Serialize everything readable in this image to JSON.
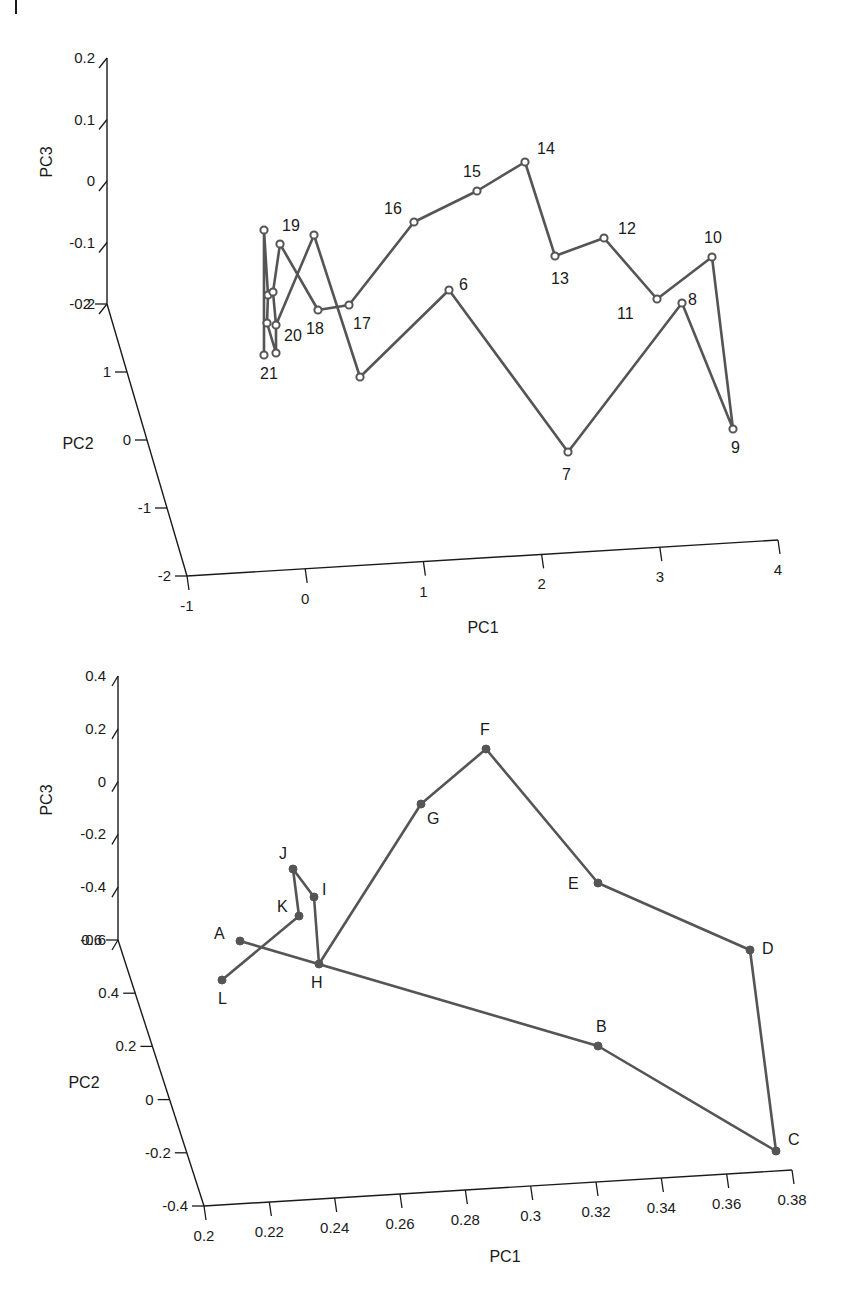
{
  "page_marker": "|",
  "chart_data": [
    {
      "type": "scatter3d-line",
      "title": "",
      "xlabel": "PC1",
      "ylabel": "PC2",
      "zlabel": "PC3",
      "x_ticks": [
        "-1",
        "0",
        "1",
        "2",
        "3",
        "4"
      ],
      "y_ticks": [
        "-2",
        "-1",
        "0",
        "1",
        "2"
      ],
      "z_ticks": [
        "-0.2",
        "-0.1",
        "0",
        "0.1",
        "0.2"
      ],
      "xlim": [
        -1,
        4
      ],
      "ylim": [
        -2,
        2
      ],
      "zlim": [
        -0.2,
        0.2
      ],
      "marker": "open-circle",
      "grid": false,
      "point_labels": [
        "6",
        "7",
        "8",
        "9",
        "10",
        "11",
        "12",
        "13",
        "14",
        "15",
        "16",
        "17",
        "18",
        "19",
        "20",
        "21"
      ],
      "screen_points": [
        {
          "label": "21",
          "px": 264,
          "py": 355
        },
        {
          "label": "",
          "px": 276,
          "py": 353
        },
        {
          "label": "",
          "px": 267,
          "py": 323
        },
        {
          "label": "20",
          "px": 276,
          "py": 325
        },
        {
          "label": "",
          "px": 268,
          "py": 295
        },
        {
          "label": "",
          "px": 273,
          "py": 292
        },
        {
          "label": "",
          "px": 264,
          "py": 230
        },
        {
          "label": "",
          "px": 280,
          "py": 244
        },
        {
          "label": "19",
          "px": 314,
          "py": 235
        },
        {
          "label": "18",
          "px": 318,
          "py": 310
        },
        {
          "label": "17",
          "px": 349,
          "py": 305
        },
        {
          "label": "16",
          "px": 414,
          "py": 222
        },
        {
          "label": "15",
          "px": 477,
          "py": 191
        },
        {
          "label": "14",
          "px": 525,
          "py": 162
        },
        {
          "label": "13",
          "px": 555,
          "py": 256
        },
        {
          "label": "12",
          "px": 604,
          "py": 238
        },
        {
          "label": "11",
          "px": 657,
          "py": 299
        },
        {
          "label": "10",
          "px": 712,
          "py": 257
        },
        {
          "label": "9",
          "px": 733,
          "py": 429
        },
        {
          "label": "8",
          "px": 682,
          "py": 303
        },
        {
          "label": "7",
          "px": 568,
          "py": 452
        },
        {
          "label": "6",
          "px": 449,
          "py": 290
        },
        {
          "label": "",
          "px": 360,
          "py": 377
        }
      ]
    },
    {
      "type": "scatter3d-line",
      "title": "",
      "xlabel": "PC1",
      "ylabel": "PC2",
      "zlabel": "PC3",
      "x_ticks": [
        "0.2",
        "0.22",
        "0.24",
        "0.26",
        "0.28",
        "0.3",
        "0.32",
        "0.34",
        "0.36",
        "0.38"
      ],
      "y_ticks": [
        "-0.4",
        "-0.2",
        "0",
        "0.2",
        "0.4",
        "0.6"
      ],
      "z_ticks": [
        "-0.6",
        "-0.4",
        "-0.2",
        "0",
        "0.2",
        "0.4"
      ],
      "xlim": [
        0.2,
        0.38
      ],
      "ylim": [
        -0.4,
        0.6
      ],
      "zlim": [
        -0.6,
        0.4
      ],
      "marker": "filled-circle",
      "grid": false,
      "point_labels": [
        "A",
        "B",
        "C",
        "D",
        "E",
        "F",
        "G",
        "H",
        "I",
        "J",
        "K",
        "L"
      ],
      "sequence": [
        "A",
        "B",
        "C",
        "D",
        "E",
        "F",
        "G",
        "H",
        "I",
        "J",
        "K",
        "L"
      ],
      "screen_points": [
        {
          "label": "A",
          "px": 240,
          "py": 941
        },
        {
          "label": "B",
          "px": 598,
          "py": 1046
        },
        {
          "label": "C",
          "px": 776,
          "py": 1151
        },
        {
          "label": "D",
          "px": 750,
          "py": 950
        },
        {
          "label": "E",
          "px": 598,
          "py": 883
        },
        {
          "label": "F",
          "px": 486,
          "py": 749
        },
        {
          "label": "G",
          "px": 421,
          "py": 804
        },
        {
          "label": "H",
          "px": 319,
          "py": 964
        },
        {
          "label": "I",
          "px": 314,
          "py": 897
        },
        {
          "label": "J",
          "px": 293,
          "py": 869
        },
        {
          "label": "K",
          "px": 299,
          "py": 916
        },
        {
          "label": "L",
          "px": 222,
          "py": 980
        }
      ]
    }
  ]
}
